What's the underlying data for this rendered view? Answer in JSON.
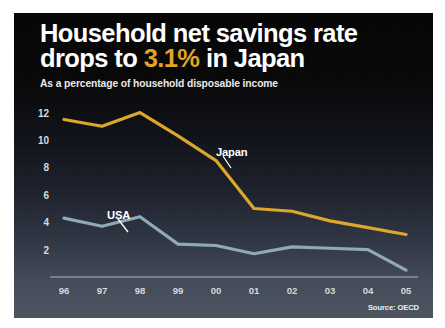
{
  "header": {
    "title_line1": "Household net savings rate",
    "title_line2_pre": "drops to ",
    "title_accent": "3.1%",
    "title_line2_post": " in Japan",
    "subtitle": "As a percentage of household disposable income"
  },
  "source": "Source: OECD",
  "colors": {
    "japan": "#dba72c",
    "usa": "#8fa9b8",
    "accent": "#e0a528",
    "axis": "#c9ccd2",
    "tick_text": "#d8dade",
    "panel_top": "#050505",
    "panel_bottom": "#4c5462"
  },
  "chart_data": {
    "type": "line",
    "title": "Household net savings rate drops to 3.1% in Japan",
    "subtitle": "As a percentage of household disposable income",
    "xlabel": "",
    "ylabel": "",
    "source": "Source: OECD",
    "grid": false,
    "legend": "inline-annotations",
    "x": [
      "96",
      "97",
      "98",
      "99",
      "00",
      "01",
      "02",
      "03",
      "04",
      "05"
    ],
    "categories": [
      "96",
      "97",
      "98",
      "99",
      "00",
      "01",
      "02",
      "03",
      "04",
      "05"
    ],
    "yticks": [
      2,
      4,
      6,
      8,
      10,
      12
    ],
    "ylim": [
      0,
      13
    ],
    "series": [
      {
        "name": "Japan",
        "color": "#dba72c",
        "values": [
          11.5,
          11.0,
          12.0,
          10.3,
          8.5,
          5.0,
          4.8,
          4.1,
          3.6,
          3.1
        ]
      },
      {
        "name": "USA",
        "color": "#8fa9b8",
        "values": [
          4.3,
          3.7,
          4.4,
          2.4,
          2.3,
          1.7,
          2.2,
          2.1,
          2.0,
          0.5
        ]
      }
    ],
    "annotations": [
      {
        "text": "Japan",
        "series": "Japan",
        "x": "00"
      },
      {
        "text": "USA",
        "series": "USA",
        "x": "97"
      }
    ]
  }
}
